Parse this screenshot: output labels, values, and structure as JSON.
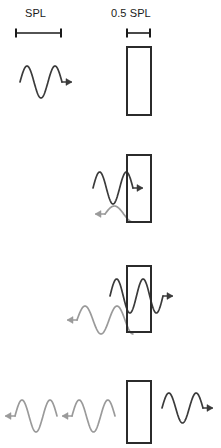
{
  "figure": {
    "type": "diagram",
    "width": 221,
    "height": 448,
    "background": "#ffffff"
  },
  "scales": {
    "full": {
      "label": "SPL",
      "bar_x1": 16,
      "bar_x2": 61,
      "bar_y": 33,
      "length_px": 45
    },
    "half": {
      "label": "0.5 SPL",
      "bar_x1": 127,
      "bar_x2": 150,
      "bar_y": 33,
      "length_px": 23
    }
  },
  "colors": {
    "incident_wave": "#3b3b3b",
    "reflected_wave": "#9a9a9a",
    "barrier_stroke": "#2b2b2b",
    "barrier_fill": "#ffffff",
    "text": "#1a1a1a"
  },
  "barrier": {
    "name": "barrier-rectangle",
    "x": 127,
    "width": 24,
    "stroke_width": 2
  },
  "panels": [
    {
      "index": 1,
      "name": "panel-incident",
      "description": "Incident wave at full SPL travelling right toward the barrier",
      "barrier": {
        "y": 47,
        "height": 68
      },
      "waves": [
        {
          "name": "incident-wave",
          "color": "incident_wave",
          "direction": "right",
          "amplitude": 16,
          "cycles": 1.5,
          "x_start": 20,
          "x_end": 62,
          "y_center": 82,
          "arrow": "right"
        }
      ]
    },
    {
      "index": 2,
      "name": "panel-partial-transmission",
      "description": "Wave meets barrier: part transmits at reduced amplitude, part reflects back at low amplitude",
      "barrier": {
        "y": 155,
        "height": 67
      },
      "waves": [
        {
          "name": "incident-wave",
          "color": "incident_wave",
          "direction": "right",
          "amplitude": 16,
          "cycles": 1.5,
          "x_start": 93,
          "x_end": 133,
          "y_center": 188,
          "arrow": "right"
        },
        {
          "name": "reflected-wave",
          "color": "reflected_wave",
          "direction": "left",
          "amplitude": 8,
          "cycles": 0.75,
          "x_start": 105,
          "x_end": 133,
          "y_center": 214,
          "arrow": "left"
        }
      ]
    },
    {
      "index": 3,
      "name": "panel-reflection-buildup",
      "description": "Reflected energy builds: larger reflected wave travels left while transmitted wave continues right",
      "barrier": {
        "y": 266,
        "height": 66
      },
      "waves": [
        {
          "name": "incident-wave",
          "color": "incident_wave",
          "direction": "right",
          "amplitude": 17,
          "cycles": 2,
          "x_start": 110,
          "x_end": 163,
          "y_center": 296,
          "arrow": "right"
        },
        {
          "name": "reflected-wave",
          "color": "reflected_wave",
          "direction": "left",
          "amplitude": 14,
          "cycles": 1.75,
          "x_start": 77,
          "x_end": 133,
          "y_center": 320,
          "arrow": "left"
        }
      ]
    },
    {
      "index": 4,
      "name": "panel-steady-state",
      "description": "Steady state: reflected waves propagate left at full SPL, transmitted wave exits right at 0.5 SPL",
      "barrier": {
        "y": 381,
        "height": 62
      },
      "waves": [
        {
          "name": "reflected-wave-far",
          "color": "reflected_wave",
          "direction": "left",
          "amplitude": 16,
          "cycles": 1.5,
          "x_start": 15,
          "x_end": 57,
          "y_center": 416,
          "arrow": "left"
        },
        {
          "name": "reflected-wave-near",
          "color": "reflected_wave",
          "direction": "left",
          "amplitude": 16,
          "cycles": 1.5,
          "x_start": 72,
          "x_end": 115,
          "y_center": 416,
          "arrow": "left"
        },
        {
          "name": "transmitted-wave",
          "color": "incident_wave",
          "direction": "right",
          "amplitude": 15,
          "cycles": 1.5,
          "x_start": 162,
          "x_end": 203,
          "y_center": 408,
          "arrow": "right"
        }
      ]
    }
  ]
}
